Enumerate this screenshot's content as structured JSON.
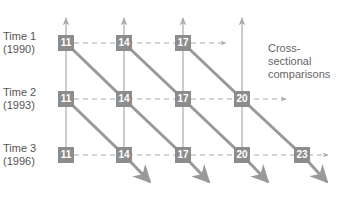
{
  "rows": [
    {
      "label_line1": "Time 1",
      "label_line2": "(1990)",
      "y": 43
    },
    {
      "label_line1": "Time 2",
      "label_line2": "(1993)",
      "y": 99
    },
    {
      "label_line1": "Time 3",
      "label_line2": "(1996)",
      "y": 155
    }
  ],
  "columns_x": [
    66,
    124,
    183,
    242,
    302
  ],
  "cells": [
    [
      {
        "value": "11",
        "col": 0
      },
      {
        "value": "14",
        "col": 1
      },
      {
        "value": "17",
        "col": 2
      }
    ],
    [
      {
        "value": "11",
        "col": 0
      },
      {
        "value": "14",
        "col": 1
      },
      {
        "value": "17",
        "col": 2
      },
      {
        "value": "20",
        "col": 3
      }
    ],
    [
      {
        "value": "11",
        "col": 0
      },
      {
        "value": "14",
        "col": 1
      },
      {
        "value": "17",
        "col": 2
      },
      {
        "value": "20",
        "col": 3
      },
      {
        "value": "23",
        "col": 4
      }
    ]
  ],
  "annotation": {
    "line1": "Cross-",
    "line2": "sectional",
    "line3": "comparisons"
  },
  "colors": {
    "box": "#8c8c8c",
    "diagonal": "#999999",
    "vertical": "#aaaaaa",
    "dashed": "#aaaaaa",
    "text": "#555555"
  }
}
